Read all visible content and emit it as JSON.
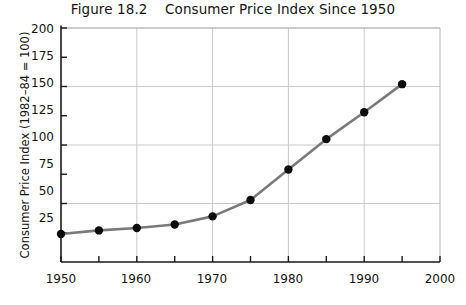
{
  "figure": {
    "title": "Figure 18.2    Consumer Price Index Since 1950"
  },
  "chart_data": {
    "type": "line",
    "title": "Figure 18.2    Consumer Price Index Since 1950",
    "xlabel": "",
    "ylabel": "Consumer Price Index (1982–84 = 100)",
    "x": [
      1950,
      1955,
      1960,
      1965,
      1970,
      1975,
      1980,
      1985,
      1990,
      1995
    ],
    "values": [
      24,
      27,
      29,
      32,
      39,
      53,
      79,
      105,
      128,
      152
    ],
    "series": [
      {
        "name": "Consumer Price Index",
        "values": [
          24,
          27,
          29,
          32,
          39,
          53,
          79,
          105,
          128,
          152
        ]
      }
    ],
    "xlim": [
      1950,
      2000
    ],
    "ylim": [
      0,
      200
    ],
    "x_major_ticks": [
      1950,
      1960,
      1970,
      1980,
      1990,
      2000
    ],
    "x_minor_ticks": [
      1955,
      1965,
      1975,
      1985,
      1995
    ],
    "y_major_ticks": [
      50,
      100,
      150,
      200
    ],
    "y_all_ticks": [
      25,
      50,
      75,
      100,
      125,
      150,
      175,
      200
    ],
    "xticklabels": [
      "1950",
      "1960",
      "1970",
      "1980",
      "1990",
      "2000"
    ],
    "yticklabels": [
      "25",
      "50",
      "75",
      "100",
      "125",
      "150",
      "175",
      "200"
    ],
    "grid": "major-xy",
    "grid_color": "#c9c9c9",
    "legend": "none",
    "line_color": "#7a7a7a",
    "marker_color": "#0d0d0d",
    "marker": "circle"
  },
  "axes": {
    "y_tick_labels": [
      "200",
      "175",
      "150",
      "125",
      "100",
      "75",
      "50",
      "25"
    ],
    "x_tick_labels": [
      "1950",
      "1960",
      "1970",
      "1980",
      "1990",
      "2000"
    ]
  }
}
